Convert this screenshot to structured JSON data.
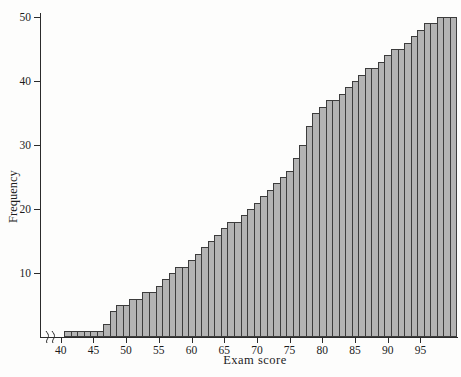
{
  "figure": {
    "width": 461,
    "height": 377,
    "background_color": "#fdfdfc",
    "axis_color": "#2b2b2b",
    "text_color": "#1c1c1c",
    "bar_fill_color": "#b3b3b3",
    "bar_border_color": "#3c3c3c"
  },
  "chart_data": {
    "type": "bar",
    "subtype": "cumulative-frequency-histogram",
    "title": "",
    "xlabel": "Exam score",
    "ylabel": "Frequency",
    "legend": "none",
    "grid": "off",
    "bar_width_units": 1,
    "xlim": [
      40,
      101
    ],
    "ylim": [
      0,
      50
    ],
    "x_ticks": [
      40,
      45,
      50,
      55,
      60,
      65,
      70,
      75,
      80,
      85,
      90,
      95
    ],
    "y_ticks": [
      10,
      20,
      30,
      40,
      50
    ],
    "axis_break": "squiggle marks on x-axis between origin and 40 tick",
    "x": [
      41,
      42,
      43,
      44,
      45,
      46,
      47,
      48,
      49,
      50,
      51,
      52,
      53,
      54,
      55,
      56,
      57,
      58,
      59,
      60,
      61,
      62,
      63,
      64,
      65,
      66,
      67,
      68,
      69,
      70,
      71,
      72,
      73,
      74,
      75,
      76,
      77,
      78,
      79,
      80,
      81,
      82,
      83,
      84,
      85,
      86,
      87,
      88,
      89,
      90,
      91,
      92,
      93,
      94,
      95,
      96,
      97,
      98,
      99,
      100
    ],
    "values": [
      1,
      1,
      1,
      1,
      1,
      1,
      2,
      4,
      5,
      5,
      6,
      6,
      7,
      7,
      8,
      9,
      10,
      11,
      11,
      12,
      13,
      14,
      15,
      16,
      17,
      18,
      18,
      19,
      20,
      21,
      22,
      23,
      24,
      25,
      26,
      28,
      30,
      33,
      35,
      36,
      37,
      37,
      38,
      39,
      40,
      41,
      42,
      42,
      43,
      44,
      45,
      45,
      46,
      47,
      48,
      49,
      49,
      50,
      50,
      50
    ]
  }
}
